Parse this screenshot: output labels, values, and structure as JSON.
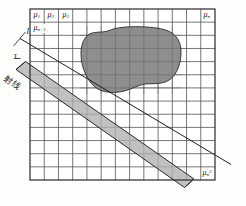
{
  "figure": {
    "grid": {
      "columns": 13,
      "rows": 13,
      "x": 30,
      "y": 9,
      "width": 185,
      "height": 171,
      "line_color": "#3a3a3a",
      "border_color": "#2a2a2a",
      "cell_fill": "#ffffff"
    },
    "object": {
      "name": "attenuating-object-blob",
      "fill": "#8e8e8e",
      "stroke": "#2a2a2a"
    },
    "beam": {
      "name": "ray-beam-band",
      "fill": "#b3b3b3",
      "stroke": "#2a2a2a",
      "angle_deg": 35
    },
    "line": {
      "name": "projection-line",
      "stroke": "#1f1f1f"
    },
    "labels": {
      "mu_1": "μ",
      "mu_1_sub": "1",
      "mu_2": "μ",
      "mu_2_sub": "2",
      "mu_3": "μ",
      "mu_3_sub": "3",
      "mu_n": "μ",
      "mu_n_sub": "n",
      "mu_n1": "μ",
      "mu_n1_sub": "n+1",
      "mu_nn": "μ",
      "mu_nn_sub": "n",
      "mu_nn_sup": "2",
      "line_label": "l",
      "ray_label": "射线",
      "tau_label": "τ"
    }
  }
}
